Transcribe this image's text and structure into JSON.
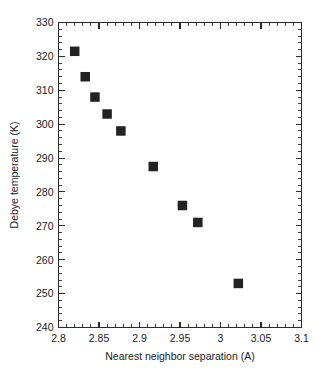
{
  "chart_data": {
    "type": "scatter",
    "title": "",
    "xlabel": "Nearest neighbor separation (A)",
    "ylabel": "Debye temperature (K)",
    "xlim": [
      2.8,
      3.1
    ],
    "ylim": [
      240,
      330
    ],
    "grid": false,
    "legend": null,
    "x_major_ticks": [
      2.8,
      2.85,
      2.9,
      2.95,
      3.0,
      3.05,
      3.1
    ],
    "x_tick_labels": [
      "2.8",
      "2.85",
      "2.9",
      "2.95",
      "3",
      "3.05",
      "3.1"
    ],
    "x_minor_step": 0.01,
    "y_major_ticks": [
      240,
      250,
      260,
      270,
      280,
      290,
      300,
      310,
      320,
      330
    ],
    "y_tick_labels": [
      "240",
      "250",
      "260",
      "270",
      "280",
      "290",
      "300",
      "310",
      "320",
      "330"
    ],
    "y_minor_step": 2,
    "marker": "filled-square",
    "marker_color": "#232323",
    "x": [
      2.82,
      2.833,
      2.845,
      2.86,
      2.877,
      2.917,
      2.953,
      2.972,
      3.022
    ],
    "y": [
      321.5,
      314.0,
      308.0,
      303.0,
      298.0,
      287.5,
      276.0,
      271.0,
      253.0
    ],
    "points": [
      {
        "x": 2.82,
        "y": 321.5
      },
      {
        "x": 2.833,
        "y": 314.0
      },
      {
        "x": 2.845,
        "y": 308.0
      },
      {
        "x": 2.86,
        "y": 303.0
      },
      {
        "x": 2.877,
        "y": 298.0
      },
      {
        "x": 2.917,
        "y": 287.5
      },
      {
        "x": 2.953,
        "y": 276.0
      },
      {
        "x": 2.972,
        "y": 271.0
      },
      {
        "x": 3.022,
        "y": 253.0
      }
    ]
  },
  "caption": {
    "text": ""
  }
}
